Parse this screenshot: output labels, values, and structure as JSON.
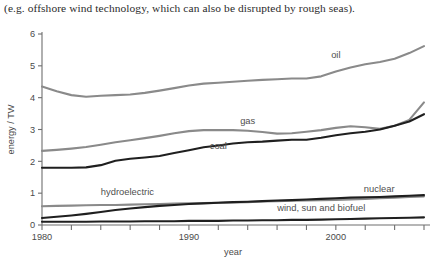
{
  "caption": "(e.g. offshore wind technology, which can also be disrupted by rough seas).",
  "axes": {
    "ylabel": "energy / TW",
    "xlabel": "year",
    "ytick_labels": [
      "0",
      "1",
      "2",
      "3",
      "4",
      "5",
      "6"
    ],
    "xtick_labels": [
      "1980",
      "1990",
      "2000"
    ]
  },
  "labels": {
    "oil": "oil",
    "gas": "gas",
    "coal": "coal",
    "hydroelectric": "hydroelectric",
    "nuclear": "nuclear",
    "wind": "wind, sun and biofuel"
  },
  "colors": {
    "gray": "#8a8a8a",
    "black": "#1f1f1f",
    "axis": "#6e6e6e",
    "text": "#4a4a4a",
    "caption": "#2b2b2b"
  },
  "chart_data": {
    "type": "line",
    "title": "",
    "xlabel": "year",
    "ylabel": "energy / TW",
    "xlim": [
      1980,
      2006
    ],
    "ylim": [
      0,
      6
    ],
    "xticks": [
      1980,
      1982,
      1984,
      1986,
      1988,
      1990,
      1992,
      1994,
      1996,
      1998,
      2000,
      2002,
      2004,
      2006
    ],
    "xtick_labels_shown": [
      1980,
      1990,
      2000
    ],
    "yticks": [
      0,
      1,
      2,
      3,
      4,
      5,
      6
    ],
    "grid": false,
    "legend": "inline-labels",
    "x": [
      1980,
      1981,
      1982,
      1983,
      1984,
      1985,
      1986,
      1987,
      1988,
      1989,
      1990,
      1991,
      1992,
      1993,
      1994,
      1995,
      1996,
      1997,
      1998,
      1999,
      2000,
      2001,
      2002,
      2003,
      2004,
      2005,
      2006
    ],
    "series": [
      {
        "name": "oil",
        "color": "#8a8a8a",
        "label_x": 2000,
        "label_y": 5.25,
        "values": [
          4.35,
          4.2,
          4.08,
          4.03,
          4.06,
          4.08,
          4.1,
          4.15,
          4.22,
          4.3,
          4.38,
          4.44,
          4.47,
          4.5,
          4.53,
          4.56,
          4.58,
          4.6,
          4.6,
          4.67,
          4.82,
          4.95,
          5.05,
          5.12,
          5.22,
          5.4,
          5.62
        ]
      },
      {
        "name": "gas",
        "color": "#8a8a8a",
        "label_x": 1994,
        "label_y": 3.18,
        "values": [
          2.33,
          2.36,
          2.4,
          2.45,
          2.52,
          2.6,
          2.66,
          2.73,
          2.8,
          2.88,
          2.95,
          2.98,
          2.98,
          2.98,
          2.96,
          2.92,
          2.87,
          2.88,
          2.93,
          2.98,
          3.05,
          3.1,
          3.07,
          3.02,
          3.12,
          3.3,
          3.85
        ]
      },
      {
        "name": "coal",
        "color": "#1f1f1f",
        "label_x": 1992,
        "label_y": 2.4,
        "values": [
          1.8,
          1.8,
          1.8,
          1.81,
          1.88,
          2.02,
          2.08,
          2.12,
          2.17,
          2.26,
          2.35,
          2.44,
          2.5,
          2.56,
          2.6,
          2.62,
          2.65,
          2.68,
          2.68,
          2.74,
          2.82,
          2.88,
          2.93,
          3.0,
          3.12,
          3.25,
          3.48
        ]
      },
      {
        "name": "hydroelectric",
        "color": "#8a8a8a",
        "label_x": 1984,
        "label_y": 0.93,
        "values": [
          0.59,
          0.6,
          0.61,
          0.62,
          0.63,
          0.63,
          0.64,
          0.65,
          0.66,
          0.67,
          0.68,
          0.69,
          0.7,
          0.71,
          0.72,
          0.74,
          0.75,
          0.76,
          0.77,
          0.78,
          0.79,
          0.8,
          0.82,
          0.84,
          0.86,
          0.88,
          0.9
        ]
      },
      {
        "name": "nuclear",
        "color": "#1f1f1f",
        "label_x": 2004,
        "label_y": 1.05,
        "values": [
          0.22,
          0.26,
          0.3,
          0.35,
          0.41,
          0.47,
          0.52,
          0.56,
          0.6,
          0.63,
          0.66,
          0.68,
          0.7,
          0.72,
          0.73,
          0.75,
          0.77,
          0.78,
          0.8,
          0.82,
          0.84,
          0.86,
          0.87,
          0.88,
          0.9,
          0.92,
          0.94
        ]
      },
      {
        "name": "wind, sun and biofuel",
        "color": "#1f1f1f",
        "label_x": 2002,
        "label_y": 0.44,
        "values": [
          0.1,
          0.1,
          0.1,
          0.1,
          0.11,
          0.11,
          0.11,
          0.12,
          0.12,
          0.12,
          0.13,
          0.13,
          0.13,
          0.14,
          0.14,
          0.15,
          0.15,
          0.16,
          0.16,
          0.17,
          0.18,
          0.19,
          0.2,
          0.21,
          0.22,
          0.23,
          0.24
        ]
      }
    ]
  }
}
